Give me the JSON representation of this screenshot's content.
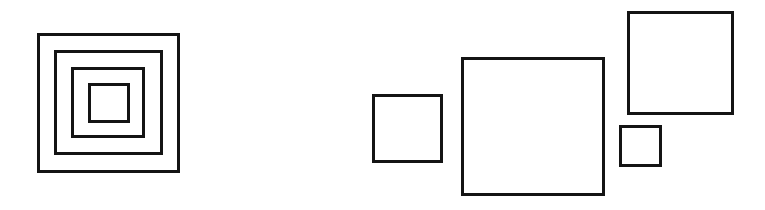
{
  "diagram": {
    "stroke_color": "#141414",
    "background": "#ffffff",
    "groups": [
      {
        "name": "concentric-squares",
        "squares": [
          {
            "name": "outer",
            "x": 37,
            "y": 33,
            "w": 143,
            "h": 140
          },
          {
            "name": "second",
            "x": 54,
            "y": 50,
            "w": 109,
            "h": 105
          },
          {
            "name": "third",
            "x": 71,
            "y": 67,
            "w": 74,
            "h": 71
          },
          {
            "name": "inner",
            "x": 88,
            "y": 83,
            "w": 42,
            "h": 40
          }
        ]
      },
      {
        "name": "separate-squares",
        "squares": [
          {
            "name": "medium-left",
            "x": 372,
            "y": 94,
            "w": 71,
            "h": 69
          },
          {
            "name": "large-center",
            "x": 461,
            "y": 57,
            "w": 144,
            "h": 139
          },
          {
            "name": "top-right",
            "x": 627,
            "y": 11,
            "w": 107,
            "h": 104
          },
          {
            "name": "small-right",
            "x": 619,
            "y": 125,
            "w": 43,
            "h": 42
          }
        ]
      }
    ]
  }
}
